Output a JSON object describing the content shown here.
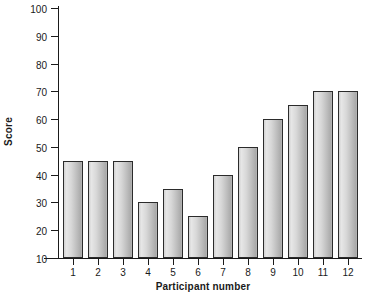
{
  "chart_data": {
    "type": "bar",
    "title": "",
    "xlabel": "Participant number",
    "ylabel": "Score",
    "categories": [
      "1",
      "2",
      "3",
      "4",
      "5",
      "6",
      "7",
      "8",
      "9",
      "10",
      "11",
      "12"
    ],
    "values": [
      45,
      45,
      45,
      30,
      35,
      25,
      40,
      50,
      60,
      65,
      70,
      70
    ],
    "ylim": [
      10,
      100
    ],
    "ytick_labels": [
      "10",
      "20",
      "30",
      "40",
      "50",
      "60",
      "70",
      "80",
      "90",
      "100"
    ],
    "yticks": [
      10,
      20,
      30,
      40,
      50,
      60,
      70,
      80,
      90,
      100
    ],
    "ytick_step": 10,
    "grid": false,
    "legend": null,
    "bar_color": "#d0d0d0",
    "bar_edge_color": "#2b2b2b",
    "background_color": "#ffffff",
    "axis_color": "#1a1a1a"
  }
}
